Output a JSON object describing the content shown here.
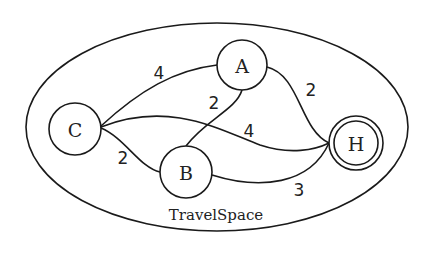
{
  "diagram": {
    "region_label": "TravelSpace",
    "nodes": [
      {
        "id": "C",
        "label": "C",
        "accepting": false
      },
      {
        "id": "A",
        "label": "A",
        "accepting": false
      },
      {
        "id": "B",
        "label": "B",
        "accepting": false
      },
      {
        "id": "H",
        "label": "H",
        "accepting": true
      }
    ],
    "edges": [
      {
        "from": "C",
        "to": "A",
        "weight": "4"
      },
      {
        "from": "C",
        "to": "B",
        "weight": "2"
      },
      {
        "from": "C",
        "to": "H",
        "weight": "4"
      },
      {
        "from": "A",
        "to": "B",
        "weight": "2"
      },
      {
        "from": "A",
        "to": "H",
        "weight": "2"
      },
      {
        "from": "B",
        "to": "H",
        "weight": "3"
      }
    ]
  }
}
